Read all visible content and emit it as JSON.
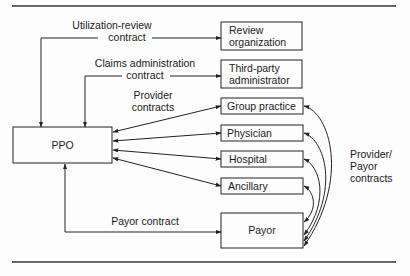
{
  "diagram": {
    "nodes": {
      "ppo": "PPO",
      "review_org": [
        "Review",
        "organization"
      ],
      "tpa": [
        "Third-party",
        "administrator"
      ],
      "group_practice": "Group practice",
      "physician": "Physician",
      "hospital": "Hospital",
      "ancillary": "Ancillary",
      "payor": "Payor"
    },
    "edge_labels": {
      "utilization_review": [
        "Utilization-review",
        "contract"
      ],
      "claims_admin": [
        "Claims administration",
        "contract"
      ],
      "provider_contracts": [
        "Provider",
        "contracts"
      ],
      "payor_contract": "Payor contract",
      "provider_payor": [
        "Provider/",
        "Payor",
        "contracts"
      ]
    },
    "colors": {
      "ink": "#222222",
      "background": "#fdfdfd"
    }
  }
}
